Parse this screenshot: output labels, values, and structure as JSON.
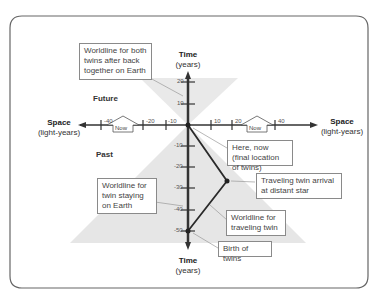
{
  "diagram": {
    "axes": {
      "time": {
        "title": "Time",
        "unit": "(years)",
        "ticks_up": [
          "20",
          "10"
        ],
        "ticks_down": [
          "-10",
          "-20",
          "-30",
          "-40",
          "-50"
        ]
      },
      "space": {
        "title": "Space",
        "unit": "(light-years)",
        "ticks_left": [
          "-40",
          "-20",
          "-10"
        ],
        "ticks_right": [
          "10",
          "20",
          "40"
        ]
      }
    },
    "regions": {
      "future": "Future",
      "past": "Past"
    },
    "now_markers": [
      "Now",
      "Now"
    ],
    "annotations": {
      "both_twins": "Worldline for both twins after back together on Earth",
      "here_now": "Here, now (final location of twins)",
      "star_arrival": "Traveling twin arrival at distant star",
      "earth_twin": "Worldline for twin staying on Earth",
      "traveling_twin": "Worldline for traveling twin",
      "birth": "Birth of twins"
    },
    "colors": {
      "axis": "#333333",
      "cone": "#e6e6e6",
      "worldline": "#2a2a2a",
      "frame": "#555555"
    }
  }
}
